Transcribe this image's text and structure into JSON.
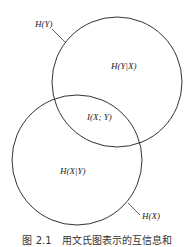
{
  "diagram": {
    "type": "venn",
    "labels": {
      "hy": "H(Y)",
      "hx": "H(X)",
      "hy_given_x": "H(Y|X)",
      "hx_given_y": "H(X|Y)",
      "mutual": "I(X; Y)"
    },
    "circles": [
      {
        "name": "H(Y)",
        "cx": 117,
        "cy": 82,
        "r": 65
      },
      {
        "name": "H(X)",
        "cx": 77,
        "cy": 160,
        "r": 65
      }
    ],
    "stroke_color": "#333333"
  },
  "caption": "图 2.1　用文氏图表示的互信息和"
}
